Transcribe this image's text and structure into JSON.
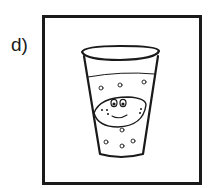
{
  "label": "d)",
  "figure": {
    "stroke_color": "#1a1a1a",
    "background": "#ffffff"
  }
}
